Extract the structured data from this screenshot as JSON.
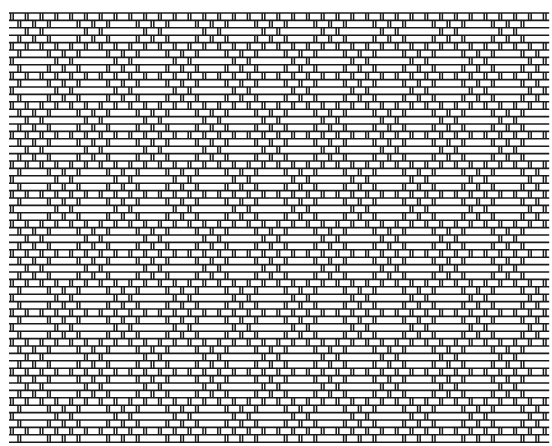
{
  "drawdown": {
    "origin_x": 9,
    "origin_y": 13,
    "cell_w": 7.4,
    "cell_h": 7.4,
    "rows": 58,
    "cols": 73,
    "col_period": 8,
    "row_period": 16,
    "line_color": "#1a1a1a",
    "bar_fill": "#ffffff",
    "background": "#ffffff"
  }
}
